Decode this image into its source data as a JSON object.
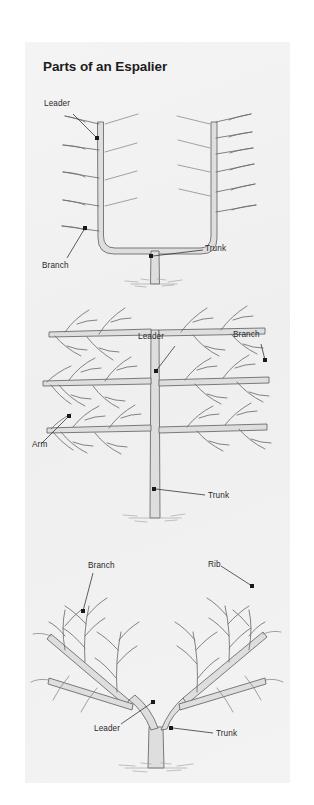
{
  "page": {
    "title": "Parts of an Espalier",
    "background_color": "#ffffff",
    "panel_color": "#f2f2f2",
    "label_color": "#2a2a2a",
    "branch_color": "#6e6e6e",
    "limb_fill": "#dedede",
    "leader_line_color": "#2b2b2b"
  },
  "figures": [
    {
      "name": "double-u-espalier",
      "form": "Double-U / U-shape espalier with vertical leaders and horizontal base arm on a central trunk",
      "labels": [
        {
          "text": "Leader",
          "x": 44,
          "y": 103,
          "dot_x": 97,
          "dot_y": 127
        },
        {
          "text": "Branch",
          "x": 42,
          "y": 263,
          "dot_x": 85,
          "dot_y": 228
        },
        {
          "text": "Trunk",
          "x": 205,
          "y": 248,
          "dot_x": 151,
          "dot_y": 256
        }
      ]
    },
    {
      "name": "horizontal-cordon-espalier",
      "form": "Horizontal cordon espalier: central vertical leader with three tiers of paired horizontal arms bearing branches",
      "labels": [
        {
          "text": "Leader",
          "x": 138,
          "y": 336,
          "dot_x": 156,
          "dot_y": 371
        },
        {
          "text": "Branch",
          "x": 233,
          "y": 334,
          "dot_x": 265,
          "dot_y": 360
        },
        {
          "text": "Arm",
          "x": 32,
          "y": 444,
          "dot_x": 70,
          "dot_y": 416
        },
        {
          "text": "Trunk",
          "x": 208,
          "y": 495,
          "dot_x": 156,
          "dot_y": 489
        }
      ]
    },
    {
      "name": "fan-palmette-espalier",
      "form": "Fan / palmette espalier: short trunk splitting into two leaders with radiating ribs and branches",
      "labels": [
        {
          "text": "Branch",
          "x": 88,
          "y": 565,
          "dot_x": 83,
          "dot_y": 611
        },
        {
          "text": "Rib",
          "x": 208,
          "y": 564,
          "dot_x": 252,
          "dot_y": 586
        },
        {
          "text": "Leader",
          "x": 94,
          "y": 728,
          "dot_x": 153,
          "dot_y": 702
        },
        {
          "text": "Trunk",
          "x": 216,
          "y": 733,
          "dot_x": 173,
          "dot_y": 728
        }
      ]
    }
  ]
}
